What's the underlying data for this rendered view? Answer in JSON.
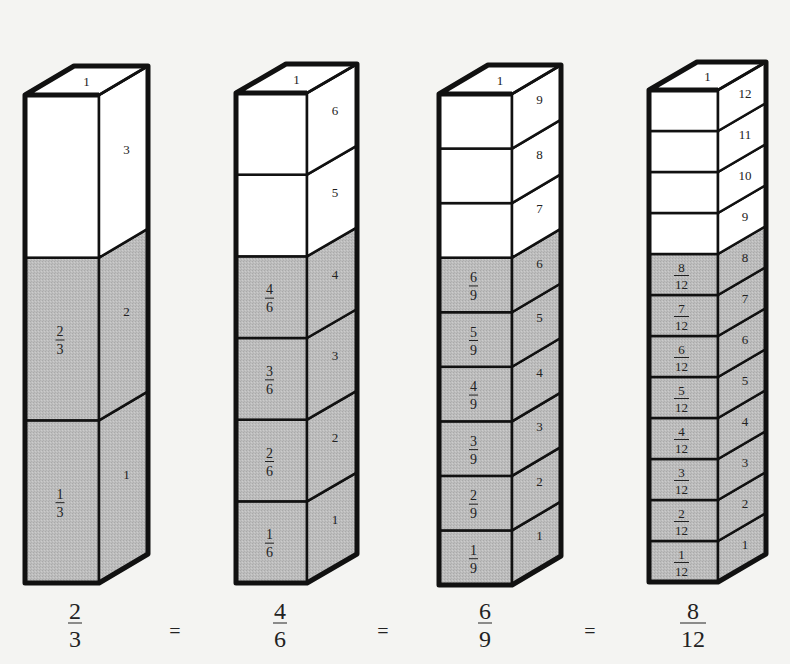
{
  "diagram": {
    "colors": {
      "shaded": "#bdbdbd",
      "unshaded": "#ffffff",
      "stroke": "#111111",
      "background": "#f4f4f2"
    },
    "columns": [
      {
        "id": "thirds",
        "denominator": 3,
        "shaded": 2,
        "top_label": "1",
        "geometry": {
          "x": 25,
          "w": 74,
          "top": 95,
          "bottom": 583,
          "dx": 49,
          "dy": 29
        },
        "front_labels": [
          "1/3",
          "2/3",
          null
        ],
        "side_labels": [
          "1",
          "2",
          "3"
        ],
        "caption": {
          "numerator": "2",
          "denominator": "3",
          "cx": 75
        }
      },
      {
        "id": "sixths",
        "denominator": 6,
        "shaded": 4,
        "top_label": "1",
        "geometry": {
          "x": 236,
          "w": 71,
          "top": 93,
          "bottom": 583,
          "dx": 50,
          "dy": 29
        },
        "front_labels": [
          "1/6",
          "2/6",
          "3/6",
          "4/6",
          null,
          null
        ],
        "side_labels": [
          "1",
          "2",
          "3",
          "4",
          "5",
          "6"
        ],
        "caption": {
          "numerator": "4",
          "denominator": "6",
          "cx": 280
        }
      },
      {
        "id": "ninths",
        "denominator": 9,
        "shaded": 6,
        "top_label": "1",
        "geometry": {
          "x": 439,
          "w": 73,
          "top": 94,
          "bottom": 585,
          "dx": 49,
          "dy": 29
        },
        "front_labels": [
          "1/9",
          "2/9",
          "3/9",
          "4/9",
          "5/9",
          "6/9",
          null,
          null,
          null
        ],
        "side_labels": [
          "1",
          "2",
          "3",
          "4",
          "5",
          "6",
          "7",
          "8",
          "9"
        ],
        "caption": {
          "numerator": "6",
          "denominator": "9",
          "cx": 485
        }
      },
      {
        "id": "twelfths",
        "denominator": 12,
        "shaded": 8,
        "top_label": "1",
        "geometry": {
          "x": 649,
          "w": 69,
          "top": 90,
          "bottom": 582,
          "dx": 48,
          "dy": 28
        },
        "front_labels": [
          "1/12",
          "2/12",
          "3/12",
          "4/12",
          "5/12",
          "6/12",
          "7/12",
          "8/12",
          null,
          null,
          null,
          null
        ],
        "side_labels": [
          "1",
          "2",
          "3",
          "4",
          "5",
          "6",
          "7",
          "8",
          "9",
          "10",
          "11",
          "12"
        ],
        "caption": {
          "numerator": "8",
          "denominator": "12",
          "cx": 693
        }
      }
    ],
    "equals": [
      {
        "symbol": "=",
        "cx": 175
      },
      {
        "symbol": "=",
        "cx": 383
      },
      {
        "symbol": "=",
        "cx": 590
      }
    ],
    "equation_text": "2/3 = 4/6 = 6/9 = 8/12"
  }
}
